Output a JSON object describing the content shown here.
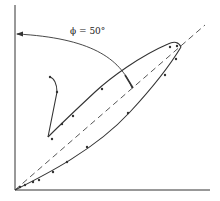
{
  "diagram": {
    "type": "hysteresis-loop",
    "angle_label": "ϕ = 50°",
    "colors": {
      "line": "#333333",
      "dashed": "#444444",
      "background": "#ffffff"
    },
    "axes": {
      "origin": [
        15,
        190
      ],
      "x_end": [
        210,
        190
      ],
      "y_end": [
        15,
        5
      ]
    },
    "diagonal": {
      "from": [
        15,
        190
      ],
      "to": [
        205,
        25
      ],
      "style": "dashed"
    },
    "lower_branch_points": [
      [
        19,
        187
      ],
      [
        23,
        185
      ],
      [
        28,
        183
      ],
      [
        33,
        182
      ],
      [
        39,
        181
      ],
      [
        53,
        172
      ],
      [
        67,
        162
      ],
      [
        87,
        147
      ],
      [
        128,
        113
      ],
      [
        165,
        75
      ],
      [
        176,
        58
      ],
      [
        180,
        48
      ]
    ],
    "upper_branch_points": [
      [
        170,
        45
      ],
      [
        102,
        89
      ],
      [
        73,
        116
      ],
      [
        62,
        124
      ],
      [
        48,
        136
      ],
      [
        50,
        139
      ]
    ],
    "hook_points": [
      [
        48,
        136
      ],
      [
        57,
        92
      ],
      [
        50,
        78
      ]
    ]
  }
}
